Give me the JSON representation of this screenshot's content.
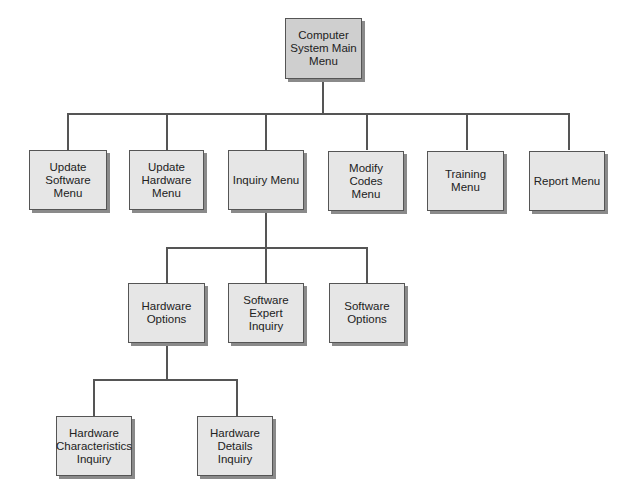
{
  "diagram": {
    "type": "hierarchy-chart",
    "root": {
      "label": "Computer\nSystem Main\nMenu"
    },
    "level1": [
      {
        "label": "Update\nSoftware\nMenu"
      },
      {
        "label": "Update\nHardware\nMenu"
      },
      {
        "label": "Inquiry Menu"
      },
      {
        "label": "Modify\nCodes\nMenu"
      },
      {
        "label": "Training Menu"
      },
      {
        "label": "Report Menu"
      }
    ],
    "level2": [
      {
        "label": "Hardware\nOptions"
      },
      {
        "label": "Software\nExpert\nInquiry"
      },
      {
        "label": "Software\nOptions"
      }
    ],
    "level3": [
      {
        "label": "Hardware\nCharacteristics\nInquiry"
      },
      {
        "label": "Hardware\nDetails\nInquiry"
      }
    ],
    "edges": [
      [
        "Computer System Main Menu",
        "Update Software Menu"
      ],
      [
        "Computer System Main Menu",
        "Update Hardware Menu"
      ],
      [
        "Computer System Main Menu",
        "Inquiry Menu"
      ],
      [
        "Computer System Main Menu",
        "Modify Codes Menu"
      ],
      [
        "Computer System Main Menu",
        "Training Menu"
      ],
      [
        "Computer System Main Menu",
        "Report Menu"
      ],
      [
        "Inquiry Menu",
        "Hardware Options"
      ],
      [
        "Inquiry Menu",
        "Software Expert Inquiry"
      ],
      [
        "Inquiry Menu",
        "Software Options"
      ],
      [
        "Hardware Options",
        "Hardware Characteristics Inquiry"
      ],
      [
        "Hardware Options",
        "Hardware Details Inquiry"
      ]
    ]
  }
}
